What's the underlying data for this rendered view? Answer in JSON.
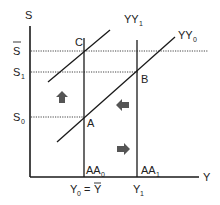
{
  "diagram": {
    "axes": {
      "y_label": "S",
      "x_label": "Y"
    },
    "y_ticks": {
      "s_bar": {
        "base": "S",
        "overbar": true,
        "sub": ""
      },
      "s1": {
        "base": "S",
        "sub": "1"
      },
      "s0": {
        "base": "S",
        "sub": "0"
      }
    },
    "x_ticks": {
      "y0": {
        "base": "Y",
        "sub": "0",
        "eq": " = ",
        "bar": "Y"
      },
      "y1": {
        "base": "Y",
        "sub": "1"
      }
    },
    "curves": {
      "yy1": {
        "base": "YY",
        "sub": "1"
      },
      "yy0": {
        "base": "YY",
        "sub": "0"
      },
      "aa0": {
        "base": "AA",
        "sub": "0"
      },
      "aa1": {
        "base": "AA",
        "sub": "1"
      }
    },
    "points": {
      "a": "A",
      "b": "B",
      "c": "C"
    },
    "arrows": [
      "up",
      "left",
      "right"
    ],
    "colors": {
      "line": "#1a1a1a",
      "arrow": "#555555",
      "dotted": "#444444"
    }
  }
}
